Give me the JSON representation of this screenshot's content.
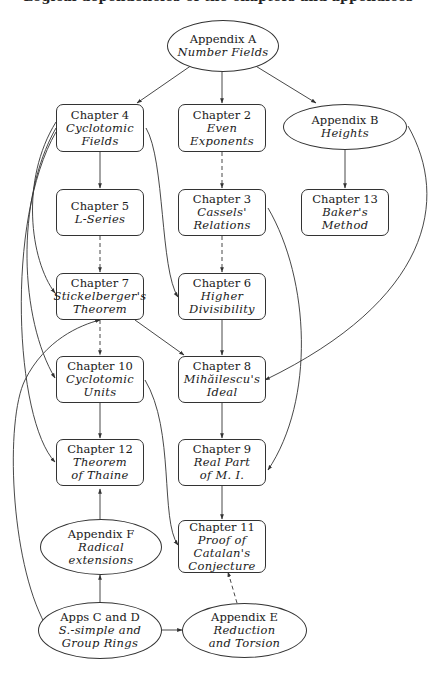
{
  "caption": "Logical dependencies of the chapters and appendices",
  "nodes": {
    "appA": {
      "title": "Appendix A",
      "sub": [
        "Number Fields"
      ],
      "shape": "ellipse"
    },
    "ch4": {
      "title": "Chapter 4",
      "sub": [
        "Cyclotomic",
        "Fields"
      ],
      "shape": "box"
    },
    "ch2": {
      "title": "Chapter 2",
      "sub": [
        "Even",
        "Exponents"
      ],
      "shape": "box"
    },
    "appB": {
      "title": "Appendix B",
      "sub": [
        "Heights"
      ],
      "shape": "ellipse"
    },
    "ch5": {
      "title": "Chapter 5",
      "sub": [
        "L-Series"
      ],
      "shape": "box"
    },
    "ch3": {
      "title": "Chapter 3",
      "sub": [
        "Cassels'",
        "Relations"
      ],
      "shape": "box"
    },
    "ch13": {
      "title": "Chapter 13",
      "sub": [
        "Baker's",
        "Method"
      ],
      "shape": "box"
    },
    "ch7": {
      "title": "Chapter 7",
      "sub": [
        "Stickelberger's",
        "Theorem"
      ],
      "shape": "box"
    },
    "ch6": {
      "title": "Chapter 6",
      "sub": [
        "Higher",
        "Divisibility"
      ],
      "shape": "box"
    },
    "ch10": {
      "title": "Chapter 10",
      "sub": [
        "Cyclotomic",
        "Units"
      ],
      "shape": "box"
    },
    "ch8": {
      "title": "Chapter 8",
      "sub": [
        "Mihăilescu's",
        "Ideal"
      ],
      "shape": "box"
    },
    "ch12": {
      "title": "Chapter 12",
      "sub": [
        "Theorem",
        "of Thaine"
      ],
      "shape": "box"
    },
    "ch9": {
      "title": "Chapter 9",
      "sub": [
        "Real Part",
        "of M. I."
      ],
      "shape": "box"
    },
    "appF": {
      "title": "Appendix F",
      "sub": [
        "Radical",
        "extensions"
      ],
      "shape": "ellipse"
    },
    "ch11": {
      "title": "Chapter 11",
      "sub": [
        "Proof of",
        "Catalan's",
        "Conjecture"
      ],
      "shape": "box"
    },
    "appCD": {
      "title": "Apps C and D",
      "sub": [
        "S.-simple and",
        "Group Rings"
      ],
      "shape": "ellipse"
    },
    "appE": {
      "title": "Appendix E",
      "sub": [
        "Reduction",
        "and Torsion"
      ],
      "shape": "ellipse"
    }
  },
  "edges": [
    {
      "from": "appA",
      "to": "ch4",
      "style": "solid"
    },
    {
      "from": "appA",
      "to": "ch2",
      "style": "solid"
    },
    {
      "from": "appA",
      "to": "appB",
      "style": "solid"
    },
    {
      "from": "ch4",
      "to": "ch5",
      "style": "solid"
    },
    {
      "from": "ch4",
      "to": "ch6",
      "style": "solid"
    },
    {
      "from": "ch4",
      "to": "ch7",
      "style": "solid"
    },
    {
      "from": "ch4",
      "to": "ch10",
      "style": "solid"
    },
    {
      "from": "ch4",
      "to": "ch12",
      "style": "solid"
    },
    {
      "from": "ch2",
      "to": "ch3",
      "style": "dashed"
    },
    {
      "from": "appB",
      "to": "ch13",
      "style": "solid"
    },
    {
      "from": "appB",
      "to": "ch8",
      "style": "solid"
    },
    {
      "from": "ch5",
      "to": "ch7",
      "style": "dashed"
    },
    {
      "from": "ch3",
      "to": "ch6",
      "style": "dashed"
    },
    {
      "from": "ch3",
      "to": "ch9",
      "style": "solid"
    },
    {
      "from": "ch7",
      "to": "ch10",
      "style": "dashed"
    },
    {
      "from": "ch7",
      "to": "ch8",
      "style": "solid"
    },
    {
      "from": "ch6",
      "to": "ch8",
      "style": "solid"
    },
    {
      "from": "ch10",
      "to": "ch12",
      "style": "solid"
    },
    {
      "from": "ch10",
      "to": "ch11",
      "style": "solid"
    },
    {
      "from": "ch8",
      "to": "ch9",
      "style": "solid"
    },
    {
      "from": "ch9",
      "to": "ch11",
      "style": "solid"
    },
    {
      "from": "appF",
      "to": "ch12",
      "style": "solid"
    },
    {
      "from": "appCD",
      "to": "appF",
      "style": "solid"
    },
    {
      "from": "appCD",
      "to": "appE",
      "style": "solid"
    },
    {
      "from": "appCD",
      "to": "ch7",
      "style": "solid"
    },
    {
      "from": "appE",
      "to": "ch11",
      "style": "dashed"
    }
  ]
}
